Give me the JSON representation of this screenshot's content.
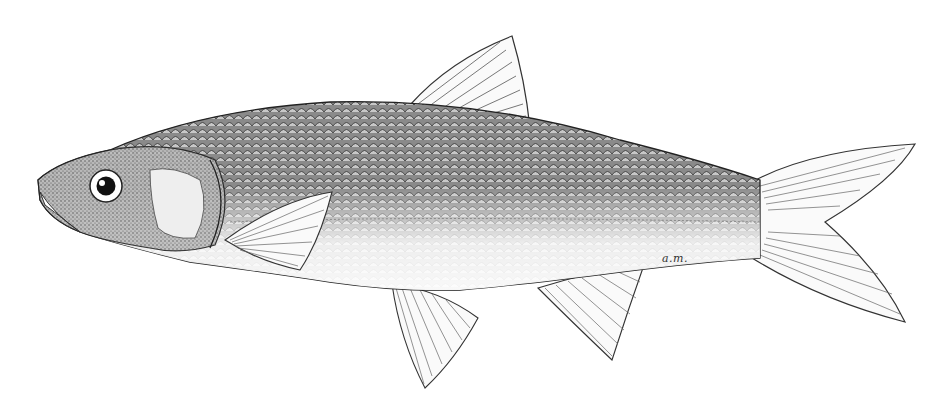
{
  "illustration": {
    "subject": "fish",
    "style": "black-and-white stipple and line drawing",
    "orientation": "facing left",
    "background_color": "#ffffff",
    "ink_color": "#1a1a1a",
    "signature": "a.m."
  }
}
